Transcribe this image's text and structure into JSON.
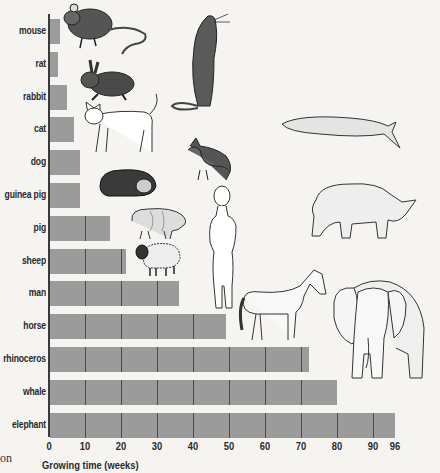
{
  "chart_data": {
    "type": "bar",
    "orientation": "horizontal",
    "title": "",
    "xlabel": "Growing time (weeks)",
    "ylabel": "",
    "xlim": [
      0,
      96
    ],
    "x_ticks": [
      0,
      10,
      20,
      30,
      40,
      50,
      60,
      70,
      80,
      90,
      96
    ],
    "gridlines": "vertical every 10 weeks drawn inside bars",
    "legend": null,
    "categories": [
      "mouse",
      "rat",
      "rabbit",
      "cat",
      "dog",
      "guinea pig",
      "pig",
      "sheep",
      "man",
      "horse",
      "rhinoceros",
      "whale",
      "elephant"
    ],
    "values": [
      3,
      2.5,
      5,
      7,
      8.5,
      8.5,
      17,
      21.5,
      36,
      49,
      72,
      80,
      96
    ],
    "series": [
      {
        "name": "Growing time (weeks)",
        "values": [
          3,
          2.5,
          5,
          7,
          8.5,
          8.5,
          17,
          21.5,
          36,
          49,
          72,
          80,
          96
        ]
      }
    ],
    "annotations": [
      "Illustrations of each animal placed beside its bar"
    ],
    "colors": {
      "bar": "#9b9b9b",
      "gridline": "#4a4a4a",
      "axis": "#3a3a3a",
      "background": "#f5f4f1"
    }
  },
  "axis": {
    "tick_labels": [
      "0",
      "10",
      "20",
      "30",
      "40",
      "50",
      "60",
      "70",
      "80",
      "90",
      "96"
    ],
    "title": "Growing time (weeks)"
  },
  "rows": [
    {
      "label": "mouse"
    },
    {
      "label": "rat"
    },
    {
      "label": "rabbit"
    },
    {
      "label": "cat"
    },
    {
      "label": "dog"
    },
    {
      "label": "guinea pig"
    },
    {
      "label": "pig"
    },
    {
      "label": "sheep"
    },
    {
      "label": "man"
    },
    {
      "label": "horse"
    },
    {
      "label": "rhinoceros"
    },
    {
      "label": "whale"
    },
    {
      "label": "elephant"
    }
  ],
  "stray_text": "on",
  "illustrations": [
    "mouse-illustration",
    "rat-illustration",
    "rabbit-illustration",
    "cat-illustration",
    "dog-illustration",
    "guinea-pig-illustration",
    "pig-illustration",
    "sheep-illustration",
    "human-illustration",
    "horse-illustration",
    "rhinoceros-illustration",
    "whale-illustration",
    "elephant-illustration"
  ]
}
